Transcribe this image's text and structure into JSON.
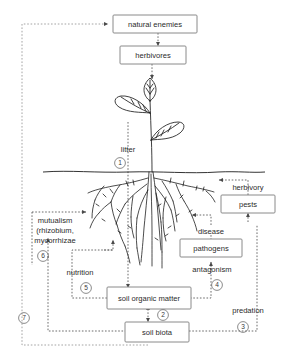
{
  "figure": {
    "title": "",
    "type": "soil-plant interaction diagram"
  },
  "boxes": [
    {
      "id": "natural-enemies",
      "label": "natural enemies"
    },
    {
      "id": "herbivores",
      "label": "herbivores"
    },
    {
      "id": "pests",
      "label": "pests"
    },
    {
      "id": "pathogens",
      "label": "pathogens"
    },
    {
      "id": "soil-organic-matter",
      "label": "soil organic matter"
    },
    {
      "id": "soil-biota",
      "label": "soil biota"
    }
  ],
  "labels": {
    "litter": "litter",
    "herbivory": "herbivory",
    "disease": "disease",
    "antagonism": "antagonism",
    "nutrition": "nutrition",
    "predation": "predation",
    "mutualism_line1": "mutualism",
    "mutualism_line2": "(rhizobium,",
    "mutualism_line3": "mycorrhizae"
  },
  "callouts": {
    "one": "1",
    "two": "2",
    "three": "3",
    "four": "4",
    "five": "5",
    "six": "6",
    "seven": "7"
  },
  "colors": {
    "box_stroke": "#8a8a8a",
    "text": "#2b2b2b",
    "arrow": "#5a5a5a",
    "plant": "#1d1d1d",
    "background": "#ffffff"
  }
}
